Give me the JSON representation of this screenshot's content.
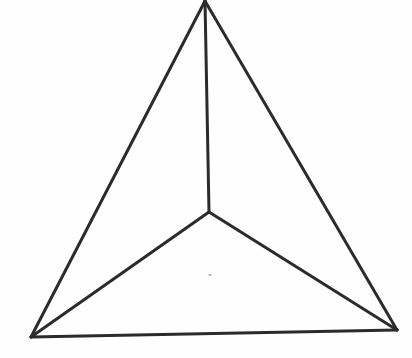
{
  "diagram": {
    "stroke_color": "#2b2b2b",
    "background_color": "#fefefe",
    "vertices": {
      "apex": {
        "x": 205,
        "y": 1
      },
      "center": {
        "x": 209,
        "y": 212
      },
      "left": {
        "x": 31,
        "y": 337
      },
      "right": {
        "x": 397,
        "y": 330
      }
    },
    "edges": [
      {
        "name": "apex-left",
        "from": "apex",
        "to": "left"
      },
      {
        "name": "apex-right",
        "from": "apex",
        "to": "right"
      },
      {
        "name": "left-right",
        "from": "left",
        "to": "right"
      },
      {
        "name": "apex-center",
        "from": "apex",
        "to": "center"
      },
      {
        "name": "center-left",
        "from": "center",
        "to": "left"
      },
      {
        "name": "center-right",
        "from": "center",
        "to": "right"
      }
    ]
  }
}
